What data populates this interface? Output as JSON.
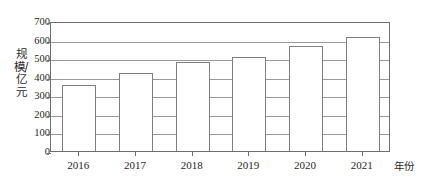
{
  "chart_data": {
    "type": "bar",
    "title": "",
    "categories": [
      "2016",
      "2017",
      "2018",
      "2019",
      "2020",
      "2021"
    ],
    "values": [
      355,
      420,
      478,
      505,
      563,
      615
    ],
    "series": [
      {
        "name": "规模/亿元",
        "values": [
          355,
          420,
          478,
          505,
          563,
          615
        ]
      }
    ],
    "xlabel": "年份",
    "ylabel": "规模/亿元",
    "ylim": [
      0,
      700
    ],
    "yticks": [
      0,
      100,
      200,
      300,
      400,
      500,
      600,
      700
    ],
    "ytick_labels": [
      "0",
      "100",
      "200",
      "300",
      "400",
      "500",
      "600",
      "700"
    ],
    "xtick_labels": [
      "2016",
      "2017",
      "2018",
      "2019",
      "2020",
      "2021"
    ],
    "grid": "horizontal",
    "legend": "none",
    "bar_fill_color": "#ffffff",
    "bar_border_color": "#808080",
    "gridline_color": "#9a9a9a",
    "frame_color": "#6f6f6f",
    "text_color": "#1f1f1f"
  }
}
